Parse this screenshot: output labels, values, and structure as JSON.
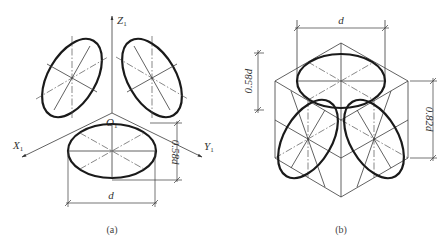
{
  "figure_a": {
    "caption": "(a)",
    "axes": {
      "z_label": "Z",
      "z_sub": "1",
      "x_label": "X",
      "x_sub": "1",
      "y_label": "Y",
      "y_sub": "1",
      "origin_label": "O",
      "origin_sub": "1"
    },
    "dimensions": {
      "height_label": "0.58d",
      "width_label": "d"
    }
  },
  "figure_b": {
    "caption": "(b)",
    "dimensions": {
      "top_width_label": "d",
      "left_height_label": "0.58d",
      "right_height_label": "0.82d"
    }
  }
}
